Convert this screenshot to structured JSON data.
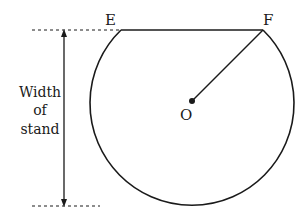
{
  "diagram": {
    "labels": {
      "point_e": "E",
      "point_f": "F",
      "center_o": "O"
    },
    "dimension": {
      "line1": "Width",
      "line2": "of",
      "line3": "stand"
    },
    "colors": {
      "stroke": "#1a1a1a",
      "background": "#ffffff"
    }
  }
}
